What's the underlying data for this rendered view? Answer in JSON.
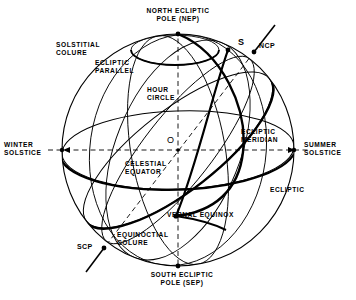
{
  "diagram": {
    "background_color": "#ffffff",
    "line_color": "#000000",
    "geometry": {
      "center": {
        "x": 178,
        "y": 150,
        "label": "O"
      },
      "radius": 116,
      "nep": {
        "x": 178,
        "y": 34
      },
      "sep": {
        "x": 178,
        "y": 266
      },
      "ncp": {
        "x": 254,
        "y": 52
      },
      "scp": {
        "x": 104,
        "y": 248
      },
      "vernal_equinox": {
        "x": 176,
        "y": 216
      },
      "star_s": {
        "x": 228,
        "y": 50
      },
      "winter_solstice": {
        "x": 62,
        "y": 150
      },
      "summer_solstice": {
        "x": 294,
        "y": 150
      }
    },
    "labels": [
      {
        "id": "nep",
        "text": "NORTH ECLIPTIC\nPOLE (NEP)",
        "x": 178,
        "y": 8,
        "align": "center"
      },
      {
        "id": "solstitial_colure",
        "text": "SOLSTITIAL\nCOLURE",
        "x": 62,
        "y": 42,
        "align": "left"
      },
      {
        "id": "ecliptic_parallel",
        "text": "ECLIPTIC\nPARALLEL",
        "x": 96,
        "y": 60,
        "align": "left"
      },
      {
        "id": "star_s",
        "text": "S",
        "x": 240,
        "y": 40,
        "align": "left"
      },
      {
        "id": "ncp",
        "text": "NCP",
        "x": 258,
        "y": 44,
        "align": "left"
      },
      {
        "id": "hour_circle",
        "text": "HOUR\nCIRCLE",
        "x": 148,
        "y": 88,
        "align": "left"
      },
      {
        "id": "origin_o",
        "text": "O",
        "x": 168,
        "y": 138,
        "align": "left"
      },
      {
        "id": "ecliptic_meridian",
        "text": "ECLIPTIC\nMERIDIAN",
        "x": 241,
        "y": 130,
        "align": "left"
      },
      {
        "id": "winter_solstice",
        "text": "WINTER\nSOLSTICE",
        "x": 4,
        "y": 142,
        "align": "left"
      },
      {
        "id": "summer_solstice",
        "text": "SUMMER\nSOLSTICE",
        "x": 303,
        "y": 142,
        "align": "left"
      },
      {
        "id": "celestial_equator",
        "text": "CELESTIAL\nEQUATOR",
        "x": 126,
        "y": 162,
        "align": "left"
      },
      {
        "id": "ecliptic",
        "text": "ECLIPTIC",
        "x": 270,
        "y": 188,
        "align": "left"
      },
      {
        "id": "vernal_equinox",
        "text": "VERNAL EQUINOX",
        "x": 166,
        "y": 212,
        "align": "left"
      },
      {
        "id": "equinoctial_colure",
        "text": "EQUINOCTIAL\nCOLURE",
        "x": 118,
        "y": 232,
        "align": "left"
      },
      {
        "id": "scp",
        "text": "SCP",
        "x": 78,
        "y": 244,
        "align": "left"
      },
      {
        "id": "sep",
        "text": "SOUTH ECLIPTIC\nPOLE (SEP)",
        "x": 178,
        "y": 272,
        "align": "center"
      }
    ],
    "features": [
      {
        "id": "outer-circle",
        "name": "celestial-sphere-outline",
        "style": "thin-solid"
      },
      {
        "id": "ecliptic",
        "name": "ecliptic-great-circle",
        "style": "thick-solid"
      },
      {
        "id": "celestial-equator",
        "name": "celestial-equator-great-circle",
        "style": "thick-solid"
      },
      {
        "id": "ecliptic-meridian",
        "name": "ecliptic-meridian",
        "style": "thick-solid"
      },
      {
        "id": "hour-circle",
        "name": "hour-circle",
        "style": "thin-solid"
      },
      {
        "id": "ecliptic-parallel",
        "name": "ecliptic-parallel-small-circle",
        "style": "thin-solid"
      },
      {
        "id": "solstitial-colure",
        "name": "solstitial-colure",
        "style": "thin-solid"
      },
      {
        "id": "equinoctial-colure",
        "name": "equinoctial-colure",
        "style": "thin-solid"
      },
      {
        "id": "polar-axis",
        "name": "ncp-scp-polar-axis",
        "style": "dashed"
      },
      {
        "id": "ecliptic-axis",
        "name": "nep-sep-ecliptic-axis",
        "style": "dashed"
      },
      {
        "id": "solstice-axis",
        "name": "winter-summer-solstice-axis",
        "style": "dashed"
      }
    ]
  }
}
